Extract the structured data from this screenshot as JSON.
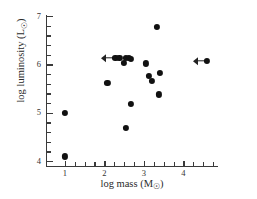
{
  "chart_data": {
    "type": "scatter",
    "title": "",
    "subtitle": "",
    "xlabel": "log mass (M☉)",
    "ylabel": "log luminosity (L☉)",
    "xlim": [
      0.55,
      4.85
    ],
    "ylim": [
      3.9,
      7.0
    ],
    "grid": false,
    "legend": null,
    "xticks": [
      1,
      2,
      3,
      4
    ],
    "xticklabels": [
      "1",
      "2",
      "3",
      "4"
    ],
    "yticks": [
      4,
      5,
      6,
      7
    ],
    "yticklabels": [
      "4",
      "5",
      "6",
      "7"
    ],
    "x_minor_ticks": [
      1.25,
      1.5,
      1.75,
      2.25,
      2.5,
      2.75,
      3.25,
      3.5,
      3.75,
      4.25,
      4.5,
      4.75
    ],
    "y_minor_ticks": [
      4.2,
      4.4,
      4.6,
      4.8,
      5.2,
      5.4,
      5.6,
      5.8,
      6.2,
      6.4,
      6.6,
      6.8
    ],
    "marker": "filled-circle",
    "marker_color": "#111111",
    "axis_color": "#3a3a3a",
    "background": "#ffffff",
    "points": [
      {
        "x": 1.0,
        "y": 5.0,
        "upper_limit_x": false
      },
      {
        "x": 1.0,
        "y": 4.1,
        "upper_limit_x": false
      },
      {
        "x": 2.08,
        "y": 5.62,
        "upper_limit_x": false
      },
      {
        "x": 2.28,
        "y": 6.13,
        "upper_limit_x": true
      },
      {
        "x": 2.38,
        "y": 6.13,
        "upper_limit_x": false
      },
      {
        "x": 2.5,
        "y": 6.03,
        "upper_limit_x": false
      },
      {
        "x": 2.55,
        "y": 6.13,
        "upper_limit_x": false
      },
      {
        "x": 2.62,
        "y": 6.13,
        "upper_limit_x": false
      },
      {
        "x": 2.68,
        "y": 6.12,
        "upper_limit_x": false
      },
      {
        "x": 2.55,
        "y": 4.68,
        "upper_limit_x": false
      },
      {
        "x": 2.67,
        "y": 5.18,
        "upper_limit_x": false
      },
      {
        "x": 3.05,
        "y": 6.02,
        "upper_limit_x": false
      },
      {
        "x": 3.13,
        "y": 5.77,
        "upper_limit_x": false
      },
      {
        "x": 3.2,
        "y": 5.66,
        "upper_limit_x": false
      },
      {
        "x": 3.33,
        "y": 6.77,
        "upper_limit_x": false
      },
      {
        "x": 3.4,
        "y": 5.82,
        "upper_limit_x": false
      },
      {
        "x": 3.38,
        "y": 5.38,
        "upper_limit_x": false
      },
      {
        "x": 4.6,
        "y": 6.07,
        "upper_limit_x": true
      }
    ]
  },
  "figure": {
    "xlabel_main": "log mass (M",
    "xlabel_sun": "☉",
    "xlabel_close": ")",
    "ylabel_main": "log luminosity (L",
    "ylabel_sun": "☉",
    "ylabel_close": ")"
  }
}
